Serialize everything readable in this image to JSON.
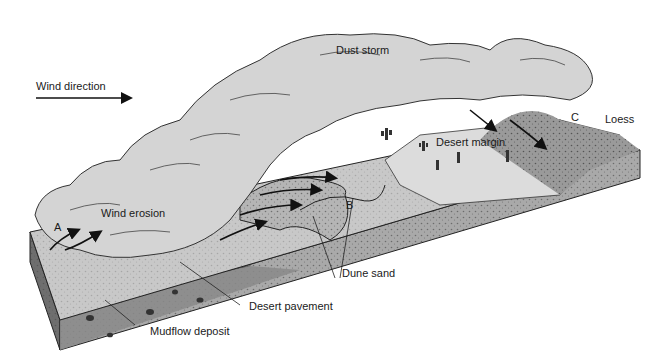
{
  "diagram": {
    "type": "block-diagram",
    "labels": {
      "wind_direction": "Wind direction",
      "dust_storm": "Dust storm",
      "wind_erosion": "Wind erosion",
      "desert_margin": "Desert margin",
      "loess": "Loess",
      "dune_sand": "Dune sand",
      "desert_pavement": "Desert pavement",
      "mudflow_deposit": "Mudflow deposit",
      "point_a": "A",
      "point_b": "B",
      "point_c": "C"
    },
    "colors": {
      "background": "#ffffff",
      "cloud": "#d2d2d2",
      "surface": "#c4c4c4",
      "block_side": "#8e8e8e",
      "block_front": "#a9a9a9",
      "ink": "#1a1a1a"
    }
  }
}
